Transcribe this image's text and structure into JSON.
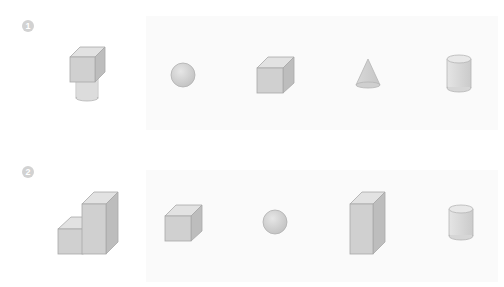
{
  "exercises": [
    {
      "number": "1",
      "shapes": [
        {
          "name": "cube-on-cylinder",
          "label": "cube stacked on cylinder"
        },
        {
          "name": "sphere",
          "label": "sphere"
        },
        {
          "name": "cube",
          "label": "cube"
        },
        {
          "name": "cone",
          "label": "cone"
        },
        {
          "name": "cylinder",
          "label": "cylinder"
        }
      ]
    },
    {
      "number": "2",
      "shapes": [
        {
          "name": "stepped-blocks",
          "label": "two joined rectangular prisms (short and tall)"
        },
        {
          "name": "cube",
          "label": "cube"
        },
        {
          "name": "sphere",
          "label": "sphere"
        },
        {
          "name": "tall-rectangular-prism",
          "label": "tall rectangular prism"
        },
        {
          "name": "cylinder",
          "label": "cylinder"
        }
      ]
    }
  ],
  "colors": {
    "face_front": "#d4d4d4",
    "face_top": "#e2e2e2",
    "face_side": "#bdbdbd",
    "edge": "#a8a8a8",
    "badge": "#d2d2d2",
    "background_block": "#fafafa"
  }
}
